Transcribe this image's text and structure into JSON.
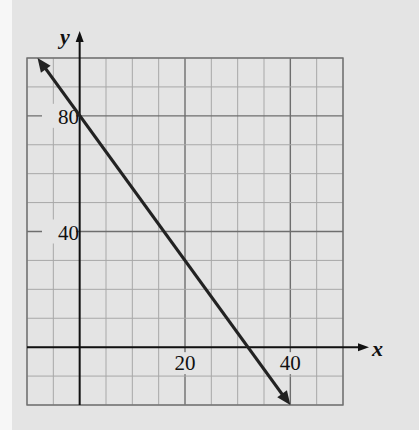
{
  "chart_data": {
    "type": "line",
    "title": "",
    "xlabel": "x",
    "ylabel": "y",
    "xlim": [
      -10,
      50
    ],
    "ylim": [
      -20,
      100
    ],
    "x_grid_step": 5,
    "y_grid_step": 10,
    "grid": true,
    "x_tick_labels": [
      {
        "value": 20,
        "label": "20"
      },
      {
        "value": 40,
        "label": "40"
      }
    ],
    "y_tick_labels": [
      {
        "value": 40,
        "label": "40"
      },
      {
        "value": 80,
        "label": "80"
      }
    ],
    "series": [
      {
        "name": "y = 80 - 2.5x",
        "equation": "y = 80 - 2.5x",
        "x": [
          -8,
          0,
          32,
          40
        ],
        "y": [
          100,
          80,
          0,
          -20
        ],
        "arrows_both_ends": true
      }
    ],
    "intercepts": {
      "y_intercept": 80,
      "x_intercept": 32
    }
  },
  "colors": {
    "background": "#e4e4e4",
    "grid": "#a8a8a8",
    "grid_major": "#6e6e6e",
    "axis": "#111111",
    "line": "#222222"
  }
}
